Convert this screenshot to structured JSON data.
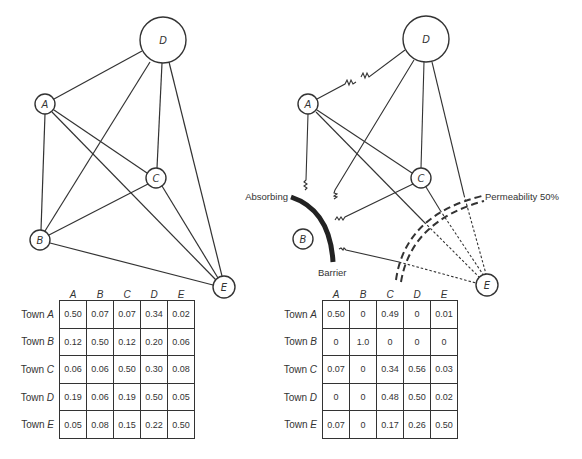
{
  "left_diagram": {
    "title": "Unobstructed interaction network",
    "nodes": [
      {
        "id": "A",
        "label": "A",
        "x": 45,
        "y": 104,
        "r": 10
      },
      {
        "id": "B",
        "label": "B",
        "x": 40,
        "y": 240,
        "r": 10
      },
      {
        "id": "C",
        "label": "C",
        "x": 156,
        "y": 178,
        "r": 10
      },
      {
        "id": "D",
        "label": "D",
        "x": 163,
        "y": 40,
        "r": 23
      },
      {
        "id": "E",
        "label": "E",
        "x": 224,
        "y": 287,
        "r": 11
      }
    ],
    "edges": [
      [
        "A",
        "D"
      ],
      [
        "A",
        "B"
      ],
      [
        "A",
        "C"
      ],
      [
        "A",
        "E"
      ],
      [
        "B",
        "D"
      ],
      [
        "B",
        "C"
      ],
      [
        "B",
        "E"
      ],
      [
        "C",
        "D"
      ],
      [
        "C",
        "E"
      ],
      [
        "D",
        "E"
      ]
    ]
  },
  "right_diagram": {
    "nodes": [
      {
        "id": "A",
        "label": "A",
        "x": 308,
        "y": 104,
        "r": 10
      },
      {
        "id": "B",
        "label": "B",
        "x": 303,
        "y": 239,
        "r": 10
      },
      {
        "id": "C",
        "label": "C",
        "x": 421,
        "y": 178,
        "r": 10
      },
      {
        "id": "D",
        "label": "D",
        "x": 426,
        "y": 39,
        "r": 23
      },
      {
        "id": "E",
        "label": "E",
        "x": 487,
        "y": 285,
        "r": 11
      }
    ],
    "absorbing_barrier": {
      "label_top": "Absorbing",
      "label_bottom": "Barrier"
    },
    "permeable_barrier": {
      "label": "Permeability 50%"
    }
  },
  "tables": [
    {
      "id": "left",
      "columns": [
        "A",
        "B",
        "C",
        "D",
        "E"
      ],
      "row_prefix": "Town",
      "rows": [
        {
          "town": "A",
          "values": [
            "0.50",
            "0.07",
            "0.07",
            "0.34",
            "0.02"
          ]
        },
        {
          "town": "B",
          "values": [
            "0.12",
            "0.50",
            "0.12",
            "0.20",
            "0.06"
          ]
        },
        {
          "town": "C",
          "values": [
            "0.06",
            "0.06",
            "0.50",
            "0.30",
            "0.08"
          ]
        },
        {
          "town": "D",
          "values": [
            "0.19",
            "0.06",
            "0.19",
            "0.50",
            "0.05"
          ]
        },
        {
          "town": "E",
          "values": [
            "0.05",
            "0.08",
            "0.15",
            "0.22",
            "0.50"
          ]
        }
      ]
    },
    {
      "id": "right",
      "columns": [
        "A",
        "B",
        "C",
        "D",
        "E"
      ],
      "row_prefix": "Town",
      "rows": [
        {
          "town": "A",
          "values": [
            "0.50",
            "0",
            "0.49",
            "0",
            "0.01"
          ]
        },
        {
          "town": "B",
          "values": [
            "0",
            "1.0",
            "0",
            "0",
            "0"
          ]
        },
        {
          "town": "C",
          "values": [
            "0.07",
            "0",
            "0.34",
            "0.56",
            "0.03"
          ]
        },
        {
          "town": "D",
          "values": [
            "0",
            "0",
            "0.48",
            "0.50",
            "0.02"
          ]
        },
        {
          "town": "E",
          "values": [
            "0.07",
            "0",
            "0.17",
            "0.26",
            "0.50"
          ]
        }
      ]
    }
  ],
  "colors": {
    "ink": "#333333",
    "background": "#ffffff"
  }
}
